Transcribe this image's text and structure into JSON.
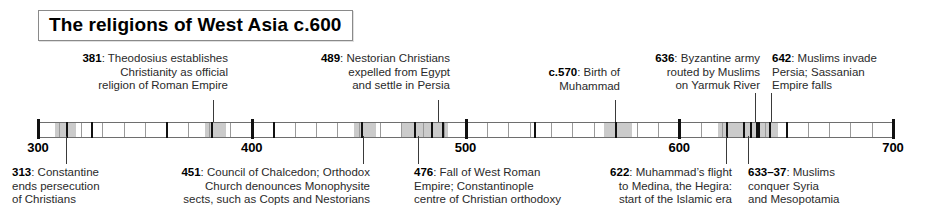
{
  "title": "The religions of West Asia c.600",
  "axis": {
    "start_year": 300,
    "end_year": 700,
    "tick_labels": [
      "300",
      "400",
      "500",
      "600",
      "700"
    ],
    "tick_years": [
      300,
      400,
      500,
      600,
      700
    ],
    "decade_interval": 10,
    "band_color": "#c2c2c2",
    "line_color": "#6e6e6e"
  },
  "events_above": [
    {
      "year": "381",
      "year_value": 381,
      "text": "Theodosius establishes Christianity as official religion of Roman Empire",
      "line1": "381: Theodosius establishes",
      "line2": "Christianity as official",
      "line3": "religion of Roman Empire"
    },
    {
      "year": "489",
      "year_value": 489,
      "text": "Nestorian Christians expelled from Egypt and settle in Persia",
      "line1": "489: Nestorian Christians",
      "line2": "expelled from Egypt",
      "line3": "and settle in Persia"
    },
    {
      "year": "c.570",
      "year_value": 570,
      "text": "Birth of Muhammad",
      "line1": "c.570: Birth of",
      "line2": "Muhammad",
      "line3": ""
    },
    {
      "year": "636",
      "year_value": 636,
      "text": "Byzantine army routed by Muslims on Yarmuk River",
      "line1": "636: Byzantine army",
      "line2": "routed by Muslims",
      "line3": "on Yarmuk River"
    },
    {
      "year": "642",
      "year_value": 642,
      "text": "Muslims invade Persia; Sassanian Empire falls",
      "line1": "642: Muslims invade",
      "line2": "Persia; Sassanian",
      "line3": "Empire falls"
    }
  ],
  "events_below": [
    {
      "year": "313",
      "year_value": 313,
      "text": "Constantine ends persecution of Christians",
      "line1": "313: Constantine",
      "line2": "ends persecution",
      "line3": "of Christians"
    },
    {
      "year": "451",
      "year_value": 451,
      "text": "Council of Chalcedon; Orthodox Church denounces Monophysite sects, such as Copts and Nestorians",
      "line1": "451: Council of Chalcedon; Orthodox",
      "line2": "Church denounces Monophysite",
      "line3": "sects, such as Copts and Nestorians"
    },
    {
      "year": "476",
      "year_value": 476,
      "text": "Fall of West Roman Empire; Constantinople centre of Christian orthodoxy",
      "line1": "476: Fall of West Roman",
      "line2": "Empire; Constantinople",
      "line3": "centre of Christian orthodoxy"
    },
    {
      "year": "622",
      "year_value": 622,
      "text": "Muhammad's flight to Medina, the Hegira: start of the Islamic era",
      "line1": "622: Muhammad’s flight",
      "line2": "to Medina, the Hegira:",
      "line3": "start of the Islamic era"
    },
    {
      "year": "633–37",
      "year_value": 635,
      "text": "Muslims conquer Syria and Mesopotamia",
      "line1": "633–37: Muslims",
      "line2": "conquer Syria",
      "line3": "and Mesopotamia"
    }
  ],
  "marked_spans": [
    {
      "from": 308,
      "to": 318
    },
    {
      "from": 378,
      "to": 388
    },
    {
      "from": 448,
      "to": 458
    },
    {
      "from": 470,
      "to": 492
    },
    {
      "from": 565,
      "to": 578
    },
    {
      "from": 618,
      "to": 646
    }
  ],
  "event_ticks": [
    313,
    325,
    360,
    381,
    410,
    451,
    476,
    484,
    489,
    532,
    570,
    622,
    630,
    633,
    636,
    637,
    642,
    650
  ]
}
